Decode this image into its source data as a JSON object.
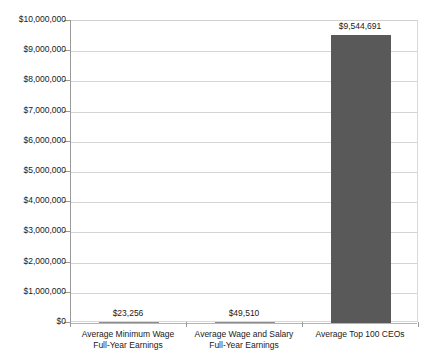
{
  "chart_data": {
    "type": "bar",
    "title": "",
    "subtitle": "",
    "xlabel": "",
    "ylabel": "",
    "ylim": [
      0,
      10000000
    ],
    "ytick_step": 1000000,
    "grid": true,
    "legend": false,
    "orientation": "vertical",
    "bar_color": "#595959",
    "gridline_color": "#d4d4d4",
    "categories": [
      "Average Minimum Wage Full-Year Earnings",
      "Average Wage and Salary Full-Year Earnings",
      "Average Top 100 CEOs"
    ],
    "category_lines": [
      [
        "Average Minimum Wage",
        "Full-Year Earnings"
      ],
      [
        "Average Wage and Salary",
        "Full-Year Earnings"
      ],
      [
        "Average Top 100 CEOs"
      ]
    ],
    "values": [
      23256,
      49510,
      9544691
    ],
    "value_labels": [
      "$23,256",
      "$49,510",
      "$9,544,691"
    ],
    "ytick_labels": [
      "$10,000,000",
      "$9,000,000",
      "$8,000,000",
      "$7,000,000",
      "$6,000,000",
      "$5,000,000",
      "$4,000,000",
      "$3,000,000",
      "$2,000,000",
      "$1,000,000",
      "$0"
    ]
  }
}
